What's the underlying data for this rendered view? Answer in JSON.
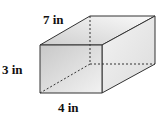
{
  "figure": {
    "type": "rectangular-prism",
    "labels": {
      "depth": "7 in",
      "height": "3 in",
      "width": "4 in"
    },
    "colors": {
      "edge": "#333333",
      "front_face": "#d9d9d9",
      "top_face": "#eeeeee",
      "side_face": "#e6e6e6"
    }
  }
}
